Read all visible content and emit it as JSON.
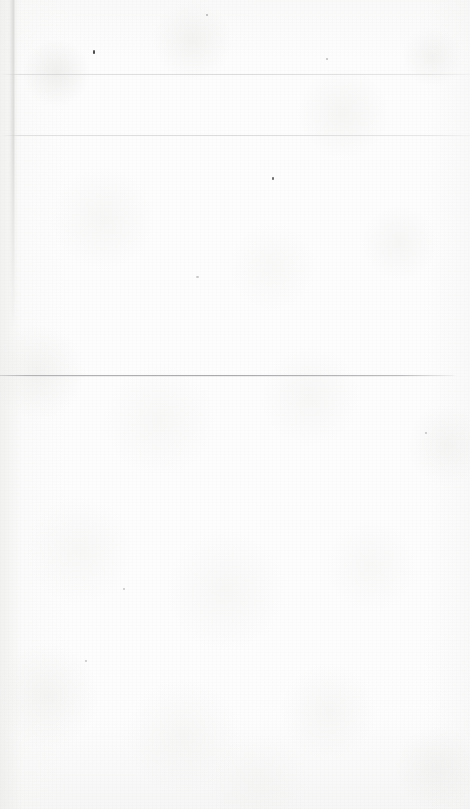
{
  "document": {
    "kind": "blank-scanned-paper",
    "width": 470,
    "height": 809,
    "visible_text": "",
    "note": "No text, UI chrome, or graphics are present in the image.",
    "background_color": "#fdfdfd",
    "paper_tone": "#f7f7f6",
    "edge_shadow_color": "#e8e8e6"
  },
  "rules": [
    {
      "name": "faint-rule-upper",
      "y": 74,
      "x": 0,
      "width": 470,
      "color": "#c7c7c7",
      "prominence": "very-faint"
    },
    {
      "name": "faint-rule-second",
      "y": 135,
      "x": 0,
      "width": 470,
      "color": "#cbcbcb",
      "prominence": "very-faint"
    },
    {
      "name": "main-divider-rule",
      "y": 375,
      "x": 0,
      "width": 456,
      "color": "#a3a3a6",
      "prominence": "faint"
    }
  ],
  "crease": {
    "name": "left-margin-crease",
    "x": 9,
    "y": 0,
    "width": 8,
    "height": 330,
    "color": "#d0d0ce"
  },
  "specks": [
    {
      "x": 93,
      "y": 50,
      "w": 2,
      "h": 4,
      "color": "#4a4a4a"
    },
    {
      "x": 272,
      "y": 177,
      "w": 2,
      "h": 3,
      "color": "#6d6d6d"
    },
    {
      "x": 206,
      "y": 14,
      "w": 2,
      "h": 2,
      "color": "#b9b9b9"
    },
    {
      "x": 326,
      "y": 58,
      "w": 2,
      "h": 2,
      "color": "#c2c2c2"
    },
    {
      "x": 196,
      "y": 276,
      "w": 3,
      "h": 2,
      "color": "#cacaca"
    },
    {
      "x": 425,
      "y": 432,
      "w": 2,
      "h": 2,
      "color": "#c6c6c6"
    },
    {
      "x": 123,
      "y": 588,
      "w": 2,
      "h": 2,
      "color": "#c8c8c8"
    },
    {
      "x": 85,
      "y": 660,
      "w": 2,
      "h": 2,
      "color": "#c9c9c9"
    }
  ]
}
